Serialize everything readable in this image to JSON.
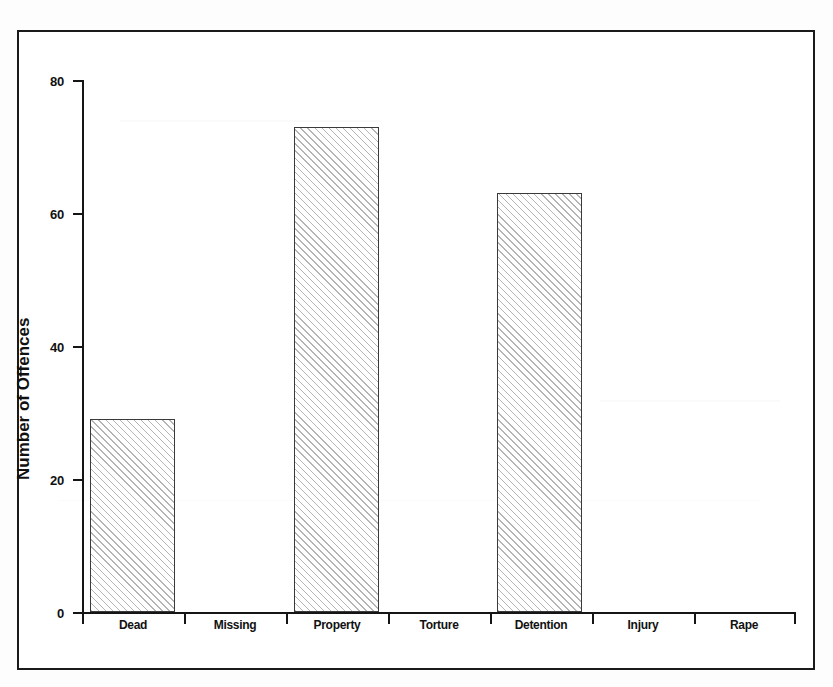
{
  "chart_data": {
    "type": "bar",
    "title": "",
    "xlabel": "",
    "ylabel": "Number of Offences",
    "categories": [
      "Dead",
      "Missing",
      "Property",
      "Torture",
      "Detention",
      "Injury",
      "Rape"
    ],
    "values": [
      29,
      0,
      73,
      0,
      63,
      0,
      0
    ],
    "ylim": [
      0,
      80
    ],
    "yticks": [
      0,
      20,
      40,
      60,
      80
    ],
    "ytick_labels": [
      "0",
      "20",
      "40",
      "60",
      "80"
    ],
    "grid": false,
    "legend": null,
    "bar_fill": "hatch-diagonal",
    "bar_edge_color": "#3a3a3a",
    "axis_color": "#151515",
    "background_color": "#ffffff"
  },
  "figure": {
    "frame_border_color": "#1a1a1a",
    "page_background": "#fdfdfd"
  }
}
